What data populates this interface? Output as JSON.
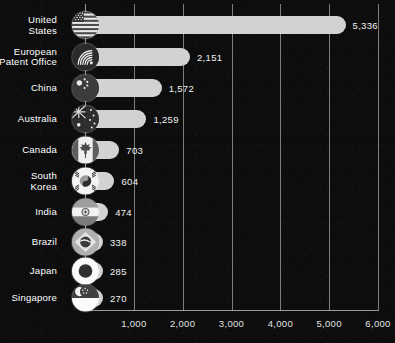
{
  "chart_data": {
    "type": "bar",
    "orientation": "horizontal",
    "title": "",
    "subtitle": "",
    "xlabel": "",
    "ylabel": "",
    "grid": true,
    "legend": "none",
    "xlim": [
      0,
      6000
    ],
    "categories": [
      "United\nStates",
      "European\nPatent Office",
      "China",
      "Australia",
      "Canada",
      "South\nKorea",
      "India",
      "Brazil",
      "Japan",
      "Singapore"
    ],
    "values": [
      5336,
      2151,
      1572,
      1259,
      703,
      604,
      474,
      338,
      285,
      270
    ],
    "value_labels": [
      "5,336",
      "2,151",
      "1,572",
      "1,259",
      "703",
      "604",
      "474",
      "338",
      "285",
      "270"
    ],
    "xtick_labels": [
      "1,000",
      "2,000",
      "3,000",
      "4,000",
      "5,000",
      "6,000"
    ],
    "xticks": [
      1000,
      2000,
      3000,
      4000,
      5000,
      6000
    ],
    "icons": [
      "flag-united-states-icon",
      "logo-european-patent-office-icon",
      "flag-china-icon",
      "flag-australia-icon",
      "flag-canada-icon",
      "flag-south-korea-icon",
      "flag-india-icon",
      "flag-brazil-icon",
      "flag-japan-icon",
      "flag-singapore-icon"
    ],
    "colors": {
      "background": "#0d0d0d",
      "bar": "#d2d2d2",
      "gridline": "#7d7d7d",
      "axis": "#9a9a9a",
      "text": "#ffffff"
    }
  },
  "rows": [
    {
      "label": "United\nStates",
      "value_label": "5,336"
    },
    {
      "label": "European\nPatent Office",
      "value_label": "2,151"
    },
    {
      "label": "China",
      "value_label": "1,572"
    },
    {
      "label": "Australia",
      "value_label": "1,259"
    },
    {
      "label": "Canada",
      "value_label": "703"
    },
    {
      "label": "South\nKorea",
      "value_label": "604"
    },
    {
      "label": "India",
      "value_label": "474"
    },
    {
      "label": "Brazil",
      "value_label": "338"
    },
    {
      "label": "Japan",
      "value_label": "285"
    },
    {
      "label": "Singapore",
      "value_label": "270"
    }
  ],
  "xaxis": {
    "ticks": [
      {
        "label": "1,000"
      },
      {
        "label": "2,000"
      },
      {
        "label": "3,000"
      },
      {
        "label": "4,000"
      },
      {
        "label": "5,000"
      },
      {
        "label": "6,000"
      }
    ]
  }
}
